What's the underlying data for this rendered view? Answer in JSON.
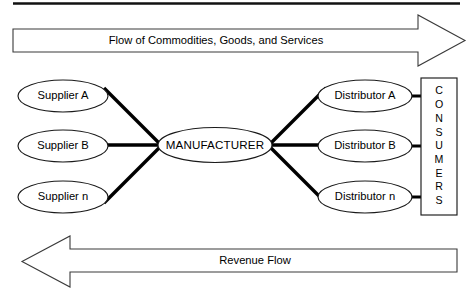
{
  "diagram": {
    "top_rule_visible": true,
    "colors": {
      "stroke": "#1a1a1a",
      "arrow_stroke": "#3a3a3a",
      "link": "#000000",
      "background": "#ffffff",
      "text": "#000000"
    },
    "flow_arrow_top": {
      "label": "Flow of Commodities, Goods, and Services",
      "direction": "right"
    },
    "flow_arrow_bottom": {
      "label": "Revenue Flow",
      "direction": "left"
    },
    "suppliers": [
      {
        "label": "Supplier A"
      },
      {
        "label": "Supplier B"
      },
      {
        "label": "Supplier n"
      }
    ],
    "manufacturer": {
      "label": "MANUFACTURER"
    },
    "distributors": [
      {
        "label": "Distributor A"
      },
      {
        "label": "Distributor B"
      },
      {
        "label": "Distributor n"
      }
    ],
    "consumers": {
      "label": "CONSUMERS",
      "letters": [
        "C",
        "O",
        "N",
        "S",
        "U",
        "M",
        "E",
        "R",
        "S"
      ],
      "orientation": "vertical"
    }
  }
}
